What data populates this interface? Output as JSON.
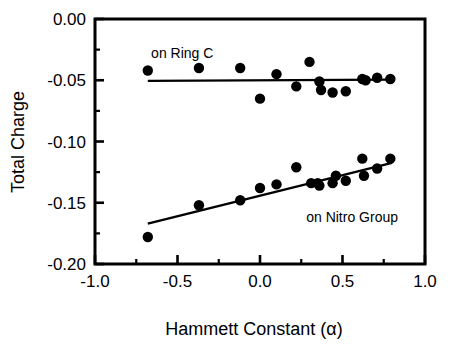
{
  "chart_data": {
    "type": "scatter",
    "title": "",
    "xlabel": "Hammett Constant (α)",
    "ylabel": "Total Charge",
    "xlim": [
      -1.0,
      1.0
    ],
    "ylim": [
      -0.2,
      0.0
    ],
    "grid": false,
    "legend_position": "inline-annotations",
    "xticks": [
      -1.0,
      -0.5,
      0.0,
      0.5,
      1.0
    ],
    "xtick_labels": [
      "-1.0",
      "-0.5",
      "0.0",
      "0.5",
      "1.0"
    ],
    "yticks": [
      0.0,
      -0.05,
      -0.1,
      -0.15,
      -0.2
    ],
    "ytick_labels": [
      "0.00",
      "-0.05",
      "-0.10",
      "-0.15",
      "-0.20"
    ],
    "xminor_ticks": [
      -0.75,
      -0.25,
      0.25,
      0.75
    ],
    "yminor_ticks": [
      -0.025,
      -0.075,
      -0.125,
      -0.175
    ],
    "marker": "filled-circle",
    "marker_color": "#000000",
    "series": [
      {
        "name": "on Ring C",
        "annotation": "on Ring C",
        "annotation_x": -0.66,
        "annotation_y": -0.028,
        "points": [
          {
            "x": -0.68,
            "y": -0.042
          },
          {
            "x": -0.37,
            "y": -0.04
          },
          {
            "x": -0.12,
            "y": -0.04
          },
          {
            "x": 0.0,
            "y": -0.065
          },
          {
            "x": 0.1,
            "y": -0.045
          },
          {
            "x": 0.22,
            "y": -0.055
          },
          {
            "x": 0.3,
            "y": -0.035
          },
          {
            "x": 0.36,
            "y": -0.051
          },
          {
            "x": 0.37,
            "y": -0.058
          },
          {
            "x": 0.44,
            "y": -0.06
          },
          {
            "x": 0.52,
            "y": -0.059
          },
          {
            "x": 0.62,
            "y": -0.049
          },
          {
            "x": 0.64,
            "y": -0.05
          },
          {
            "x": 0.71,
            "y": -0.048
          },
          {
            "x": 0.79,
            "y": -0.049
          }
        ],
        "fit": {
          "x1": -0.68,
          "y1": -0.0505,
          "x2": 0.8,
          "y2": -0.0495
        }
      },
      {
        "name": "on Nitro Group",
        "annotation": "on Nitro Group",
        "annotation_x": 0.28,
        "annotation_y": -0.162,
        "points": [
          {
            "x": -0.68,
            "y": -0.178
          },
          {
            "x": -0.37,
            "y": -0.152
          },
          {
            "x": -0.12,
            "y": -0.148
          },
          {
            "x": 0.0,
            "y": -0.138
          },
          {
            "x": 0.1,
            "y": -0.135
          },
          {
            "x": 0.22,
            "y": -0.121
          },
          {
            "x": 0.31,
            "y": -0.134
          },
          {
            "x": 0.35,
            "y": -0.134
          },
          {
            "x": 0.36,
            "y": -0.136
          },
          {
            "x": 0.44,
            "y": -0.134
          },
          {
            "x": 0.46,
            "y": -0.128
          },
          {
            "x": 0.52,
            "y": -0.132
          },
          {
            "x": 0.62,
            "y": -0.114
          },
          {
            "x": 0.63,
            "y": -0.128
          },
          {
            "x": 0.71,
            "y": -0.122
          },
          {
            "x": 0.79,
            "y": -0.114
          }
        ],
        "fit": {
          "x1": -0.68,
          "y1": -0.167,
          "x2": 0.8,
          "y2": -0.1175
        }
      }
    ]
  }
}
